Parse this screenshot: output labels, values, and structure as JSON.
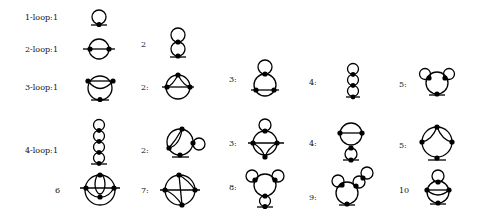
{
  "rows": [
    {
      "label": "1-loop:",
      "diagrams": [
        "1"
      ]
    },
    {
      "label": "2-loop:",
      "diagrams": [
        "1",
        "2"
      ]
    },
    {
      "label": "3-loop:",
      "diagrams": [
        "1",
        "2:",
        "3:",
        "4:",
        "5:"
      ]
    },
    {
      "label": "4-loop:",
      "diagrams": [
        "1",
        "2:",
        "3:",
        "4:",
        "5:",
        "6",
        "7:",
        "8:",
        "9:",
        "10"
      ]
    }
  ],
  "colors": {
    "line": "#000000",
    "background": "#ffffff"
  }
}
